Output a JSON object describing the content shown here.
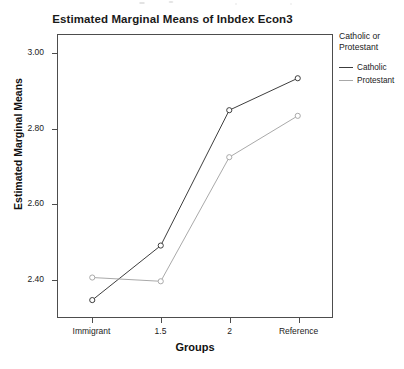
{
  "chart_data": {
    "type": "line",
    "title": "Estimated Marginal Means of Inbdex Econ3",
    "xlabel": "Groups",
    "ylabel": "Estimated Marginal Means",
    "categories": [
      "Immigrant",
      "1.5",
      "2",
      "Reference"
    ],
    "ylim": [
      2.3,
      3.05
    ],
    "yticks": [
      3.0,
      2.8,
      2.6,
      2.4
    ],
    "ytick_labels": [
      "3.00",
      "2.80",
      "2.60",
      "2.40"
    ],
    "grid": false,
    "legend_position": "right",
    "legend_title": "Catholic or Protestant",
    "series": [
      {
        "name": "Catholic",
        "color": "#3c3c3c",
        "values": [
          2.345,
          2.49,
          2.85,
          2.935
        ]
      },
      {
        "name": "Protestant",
        "color": "#a8a8a8",
        "values": [
          2.405,
          2.395,
          2.725,
          2.835
        ]
      }
    ]
  },
  "axes": {
    "y_title": "Estimated Marginal Means",
    "x_title": "Groups"
  },
  "legend": {
    "title_line_1": "Catholic or",
    "title_line_2": "Protestant",
    "items": [
      {
        "label": "Catholic",
        "color": "#3c3c3c"
      },
      {
        "label": "Protestant",
        "color": "#a8a8a8"
      }
    ]
  }
}
